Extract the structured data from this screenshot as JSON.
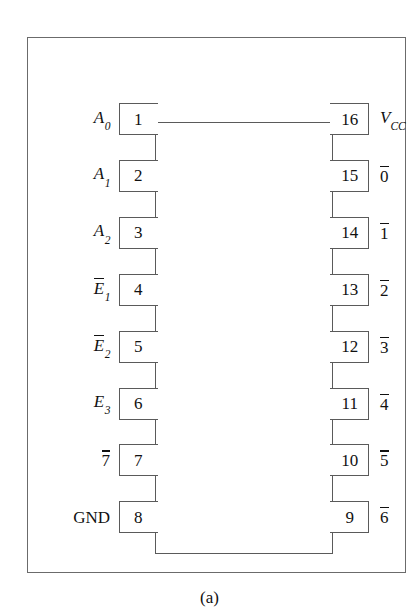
{
  "figure": {
    "caption": "(a)",
    "frame_color": "#6b6b6b",
    "chip_color": "#5a5a5a",
    "text_color": "#111111",
    "background": "#ffffff"
  },
  "chip": {
    "package": "16-pin DIP",
    "pin_count": 16
  },
  "pins_left": [
    {
      "number": "1",
      "label_base": "A",
      "label_sub": "0",
      "overbar": false,
      "plain": ""
    },
    {
      "number": "2",
      "label_base": "A",
      "label_sub": "1",
      "overbar": false,
      "plain": ""
    },
    {
      "number": "3",
      "label_base": "A",
      "label_sub": "2",
      "overbar": false,
      "plain": ""
    },
    {
      "number": "4",
      "label_base": "E",
      "label_sub": "1",
      "overbar": true,
      "plain": ""
    },
    {
      "number": "5",
      "label_base": "E",
      "label_sub": "2",
      "overbar": true,
      "plain": ""
    },
    {
      "number": "6",
      "label_base": "E",
      "label_sub": "3",
      "overbar": false,
      "plain": ""
    },
    {
      "number": "7",
      "label_base": "7",
      "label_sub": "",
      "overbar": true,
      "plain": ""
    },
    {
      "number": "8",
      "label_base": "",
      "label_sub": "",
      "overbar": false,
      "plain": "GND"
    }
  ],
  "pins_right": [
    {
      "number": "16",
      "label_base": "V",
      "label_sub": "CC",
      "overbar": false,
      "plain": ""
    },
    {
      "number": "15",
      "label_base": "0",
      "label_sub": "",
      "overbar": true,
      "plain": ""
    },
    {
      "number": "14",
      "label_base": "1",
      "label_sub": "",
      "overbar": true,
      "plain": ""
    },
    {
      "number": "13",
      "label_base": "2",
      "label_sub": "",
      "overbar": true,
      "plain": ""
    },
    {
      "number": "12",
      "label_base": "3",
      "label_sub": "",
      "overbar": true,
      "plain": ""
    },
    {
      "number": "11",
      "label_base": "4",
      "label_sub": "",
      "overbar": true,
      "plain": ""
    },
    {
      "number": "10",
      "label_base": "5",
      "label_sub": "",
      "overbar": true,
      "plain": ""
    },
    {
      "number": "9",
      "label_base": "6",
      "label_sub": "",
      "overbar": true,
      "plain": ""
    }
  ]
}
